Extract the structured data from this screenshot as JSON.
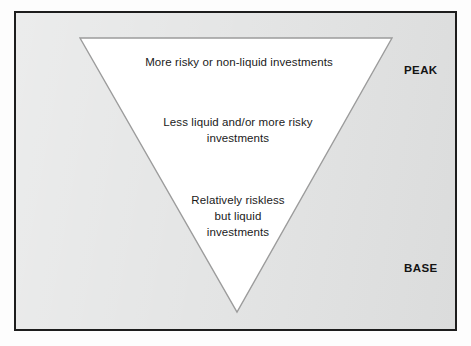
{
  "diagram": {
    "panel": {
      "background_color": "#e3e4e4",
      "border_color": "#1d1d1d"
    },
    "triangle": {
      "fill_color": "#ffffff",
      "outline_color": "#9a9a9a",
      "orientation": "inverted",
      "vertices": [
        [
          80,
          38
        ],
        [
          392,
          38
        ],
        [
          237,
          312
        ]
      ]
    },
    "text_blocks": [
      {
        "id": "top",
        "text": "More risky or non-liquid investments"
      },
      {
        "id": "middle",
        "text": "Less liquid and/or more risky\ninvestments"
      },
      {
        "id": "bottom",
        "text": "Relatively riskless\nbut liquid\ninvestments"
      }
    ],
    "side_labels": {
      "peak": "PEAK",
      "base": "BASE"
    }
  }
}
